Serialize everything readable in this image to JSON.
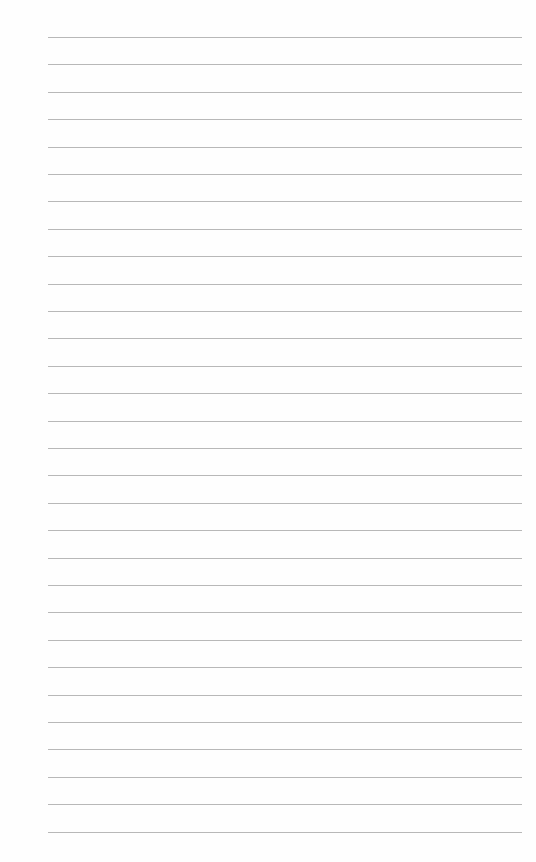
{
  "page": {
    "type": "lined-paper",
    "line_count": 30,
    "first_line_y": 37,
    "line_spacing": 27.4,
    "line_left": 48,
    "line_width": 474,
    "line_color": "#b8b8b8",
    "background_color": "#fefefe"
  }
}
